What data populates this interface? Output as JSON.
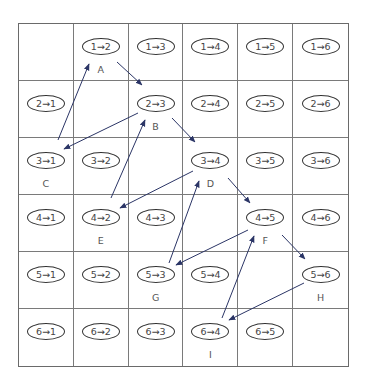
{
  "grid": {
    "rows": 6,
    "cols": 6,
    "cells": [
      [
        "",
        "1→2",
        "1→3",
        "1→4",
        "1→5",
        "1→6"
      ],
      [
        "2→1",
        "",
        "2→3",
        "2→4",
        "2→5",
        "2→6"
      ],
      [
        "3→1",
        "3→2",
        "",
        "3→4",
        "3→5",
        "3→6"
      ],
      [
        "4→1",
        "4→2",
        "4→3",
        "",
        "4→5",
        "4→6"
      ],
      [
        "5→1",
        "5→2",
        "5→3",
        "5→4",
        "",
        "5→6"
      ],
      [
        "6→1",
        "6→2",
        "6→3",
        "6→4",
        "6→5",
        ""
      ]
    ],
    "labels": [
      [
        "",
        "A",
        "",
        "",
        "",
        ""
      ],
      [
        "",
        "",
        "B",
        "",
        "",
        ""
      ],
      [
        "C",
        "",
        "",
        "D",
        "",
        ""
      ],
      [
        "",
        "E",
        "",
        "",
        "F",
        ""
      ],
      [
        "",
        "",
        "G",
        "",
        "",
        "H"
      ],
      [
        "",
        "",
        "",
        "I",
        "",
        ""
      ]
    ]
  },
  "arrows": {
    "color": "#2b3566",
    "edges": [
      {
        "from": "C",
        "to": "A",
        "x1": 58,
        "y1": 140,
        "x2": 89,
        "y2": 64
      },
      {
        "from": "A",
        "to": "B",
        "x1": 117,
        "y1": 62,
        "x2": 142,
        "y2": 85
      },
      {
        "from": "B",
        "to": "C",
        "x1": 138,
        "y1": 113,
        "x2": 64,
        "y2": 149
      },
      {
        "from": "E",
        "to": "B",
        "x1": 111,
        "y1": 198,
        "x2": 145,
        "y2": 120
      },
      {
        "from": "B",
        "to": "D",
        "x1": 172,
        "y1": 118,
        "x2": 195,
        "y2": 142
      },
      {
        "from": "D",
        "to": "E",
        "x1": 193,
        "y1": 171,
        "x2": 120,
        "y2": 208
      },
      {
        "from": "G",
        "to": "D",
        "x1": 169,
        "y1": 263,
        "x2": 199,
        "y2": 181
      },
      {
        "from": "D",
        "to": "F",
        "x1": 228,
        "y1": 178,
        "x2": 250,
        "y2": 203
      },
      {
        "from": "F",
        "to": "G",
        "x1": 248,
        "y1": 230,
        "x2": 176,
        "y2": 265
      },
      {
        "from": "I",
        "to": "F",
        "x1": 222,
        "y1": 318,
        "x2": 254,
        "y2": 236
      },
      {
        "from": "F",
        "to": "H",
        "x1": 282,
        "y1": 235,
        "x2": 305,
        "y2": 259
      },
      {
        "from": "H",
        "to": "I",
        "x1": 304,
        "y1": 283,
        "x2": 229,
        "y2": 320
      }
    ]
  }
}
